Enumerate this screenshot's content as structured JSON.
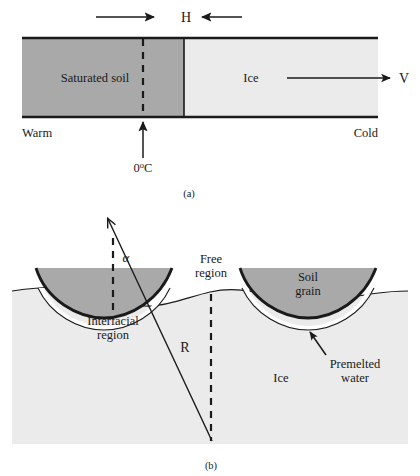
{
  "figure": {
    "title_caption_a": "(a)",
    "title_caption_b": "(b)",
    "colors": {
      "soil_fill": "#a9a9a9",
      "ice_fill": "#ebebeb",
      "grain_fill": "#a9a9a9",
      "premelted_water_fill": "#ffffff",
      "line": "#1a1a1a",
      "background": "#ffffff"
    }
  },
  "panel_a": {
    "caption": "(a)",
    "heat_label": "H",
    "velocity_label": "V",
    "soil_label": "Saturated soil",
    "ice_label": "Ice",
    "warm_label": "Warm",
    "cold_label": "Cold",
    "freezing_temp_value": "0",
    "freezing_temp_degree": "o",
    "freezing_temp_unit": "C",
    "freezing_temp_full": "0oC",
    "arrows": {
      "heat_left_direction": "right",
      "heat_right_direction": "left",
      "velocity_direction": "right",
      "freezing_front_direction": "up"
    }
  },
  "panel_b": {
    "caption": "(b)",
    "alpha_label": "α",
    "radius_label": "R",
    "free_region_line1": "Free",
    "free_region_line2": "region",
    "interfacial_line1": "Interfacial",
    "interfacial_line2": "region",
    "soil_grain_line1": "Soil",
    "soil_grain_line2": "grain",
    "premelted_line1": "Premelted",
    "premelted_line2": "water",
    "ice_label": "Ice"
  }
}
